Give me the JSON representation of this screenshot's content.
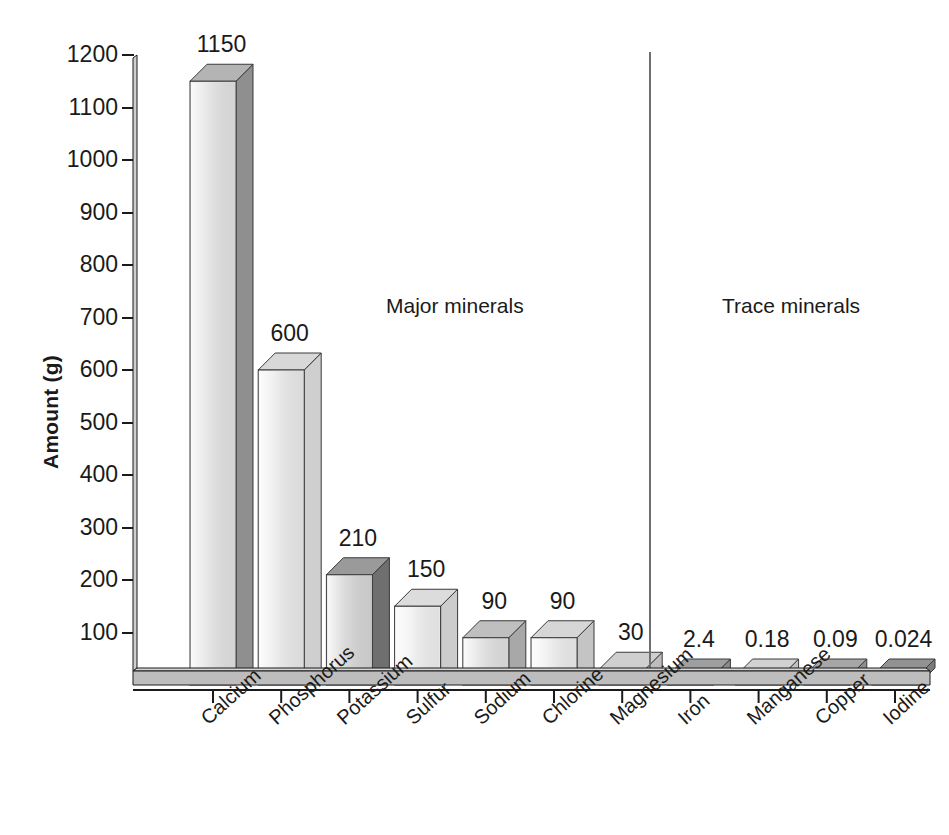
{
  "chart_data": {
    "type": "bar",
    "title": "",
    "xlabel": "",
    "ylabel": "Amount (g)",
    "ylim": [
      0,
      1200
    ],
    "yticks": [
      1200,
      1100,
      1000,
      900,
      800,
      700,
      600,
      500,
      400,
      300,
      200,
      100
    ],
    "grid": false,
    "legend": null,
    "style": "3d-isometric-bars",
    "categories": [
      "Calcium",
      "Phosphorus",
      "Potassium",
      "Sulfur",
      "Sodium",
      "Chlorine",
      "Magnesium",
      "Iron",
      "Manganese",
      "Copper",
      "Iodine"
    ],
    "values": [
      1150,
      600,
      210,
      150,
      90,
      90,
      30,
      2.4,
      0.18,
      0.09,
      0.024
    ],
    "value_labels": [
      "1150",
      "600",
      "210",
      "150",
      "90",
      "90",
      "30",
      "2.4",
      "0.18",
      "0.09",
      "0.024"
    ],
    "annotations": [
      {
        "text": "Major minerals",
        "x": 386,
        "y": 295
      },
      {
        "text": "Trace minerals",
        "x": 722,
        "y": 295
      }
    ],
    "group_divider": {
      "x": 650,
      "label": "major-trace-separator"
    },
    "groups": [
      {
        "name": "Major minerals",
        "members": [
          "Calcium",
          "Phosphorus",
          "Potassium",
          "Sulfur",
          "Sodium",
          "Chlorine",
          "Magnesium"
        ]
      },
      {
        "name": "Trace minerals",
        "members": [
          "Iron",
          "Manganese",
          "Copper",
          "Iodine"
        ]
      }
    ],
    "bar_shades": [
      {
        "front": "#e4e4e4",
        "side": "#8f8f8f",
        "top": "#b4b4b4"
      },
      {
        "front": "#ececec",
        "side": "#cfcfcf",
        "top": "#d8d8d8"
      },
      {
        "front": "#d8d8d8",
        "side": "#6f6f6f",
        "top": "#9a9a9a"
      },
      {
        "front": "#f1f1f1",
        "side": "#cccccc",
        "top": "#dcdcdc"
      },
      {
        "front": "#e2e2e2",
        "side": "#a8a8a8",
        "top": "#bfbfbf"
      },
      {
        "front": "#efefef",
        "side": "#c4c4c4",
        "top": "#d6d6d6"
      },
      {
        "front": "#e6e6e6",
        "side": "#bdbdbd",
        "top": "#cfcfcf"
      },
      {
        "front": "#c9c9c9",
        "side": "#8a8a8a",
        "top": "#9f9f9f"
      },
      {
        "front": "#ededed",
        "side": "#c0c0c0",
        "top": "#d2d2d2"
      },
      {
        "front": "#c2c2c2",
        "side": "#8e8e8e",
        "top": "#a6a6a6"
      },
      {
        "front": "#a9a9a9",
        "side": "#7a7a7a",
        "top": "#929292"
      }
    ],
    "colors": {
      "axis": "#1a1a1a",
      "text": "#1a1a1a",
      "background": "#ffffff",
      "divider": "#6f6f6f"
    }
  }
}
